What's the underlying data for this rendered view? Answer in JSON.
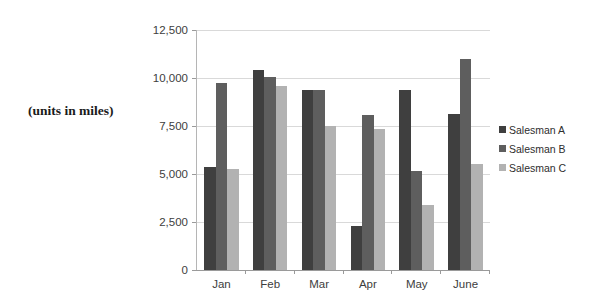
{
  "caption": "(units in miles)",
  "chart_data": {
    "type": "bar",
    "title": "",
    "subtitle": "",
    "xlabel": "",
    "ylabel": "(units in miles)",
    "categories": [
      "Jan",
      "Feb",
      "Mar",
      "Apr",
      "May",
      "June"
    ],
    "series": [
      {
        "name": "Salesman A",
        "color": "#3f3f3f",
        "values": [
          5350,
          10400,
          9400,
          2300,
          9400,
          8100
        ]
      },
      {
        "name": "Salesman B",
        "color": "#5e5e5e",
        "values": [
          9750,
          10050,
          9350,
          8050,
          5150,
          11000
        ]
      },
      {
        "name": "Salesman C",
        "color": "#b2b2b2",
        "values": [
          5250,
          9600,
          7500,
          7350,
          3400,
          5500
        ]
      }
    ],
    "ylim": [
      0,
      12500
    ],
    "yticks": [
      0,
      2500,
      5000,
      7500,
      10000,
      12500
    ],
    "ytick_labels": [
      "0",
      "2,500",
      "5,000",
      "7,500",
      "10,000",
      "12,500"
    ],
    "grid": true,
    "legend_position": "right",
    "legend_entries": [
      "Salesman A",
      "Salesman B",
      "Salesman C"
    ]
  }
}
